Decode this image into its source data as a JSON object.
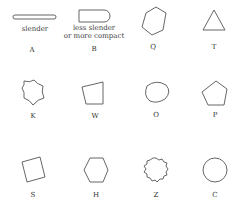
{
  "figure": {
    "shapes": [
      {
        "id": "A",
        "letter": "A",
        "caption": "slender",
        "kind": "elongated rounded bar"
      },
      {
        "id": "B",
        "letter": "B",
        "caption_line1": "less slender",
        "caption_line2": "or more compact",
        "kind": "D-shaped rectangle"
      },
      {
        "id": "Q",
        "letter": "Q",
        "kind": "irregular hexagon"
      },
      {
        "id": "T",
        "letter": "T",
        "kind": "triangle"
      },
      {
        "id": "K",
        "letter": "K",
        "kind": "concave star polygon"
      },
      {
        "id": "W",
        "letter": "W",
        "kind": "irregular quadrilateral"
      },
      {
        "id": "O",
        "letter": "O",
        "kind": "rounded blob"
      },
      {
        "id": "P",
        "letter": "P",
        "kind": "pentagon"
      },
      {
        "id": "S",
        "letter": "S",
        "kind": "tilted square"
      },
      {
        "id": "H",
        "letter": "H",
        "kind": "regular hexagon"
      },
      {
        "id": "Z",
        "letter": "Z",
        "kind": "scalloped circle"
      },
      {
        "id": "C",
        "letter": "C",
        "kind": "circle"
      }
    ],
    "stroke_color": "#555555"
  }
}
